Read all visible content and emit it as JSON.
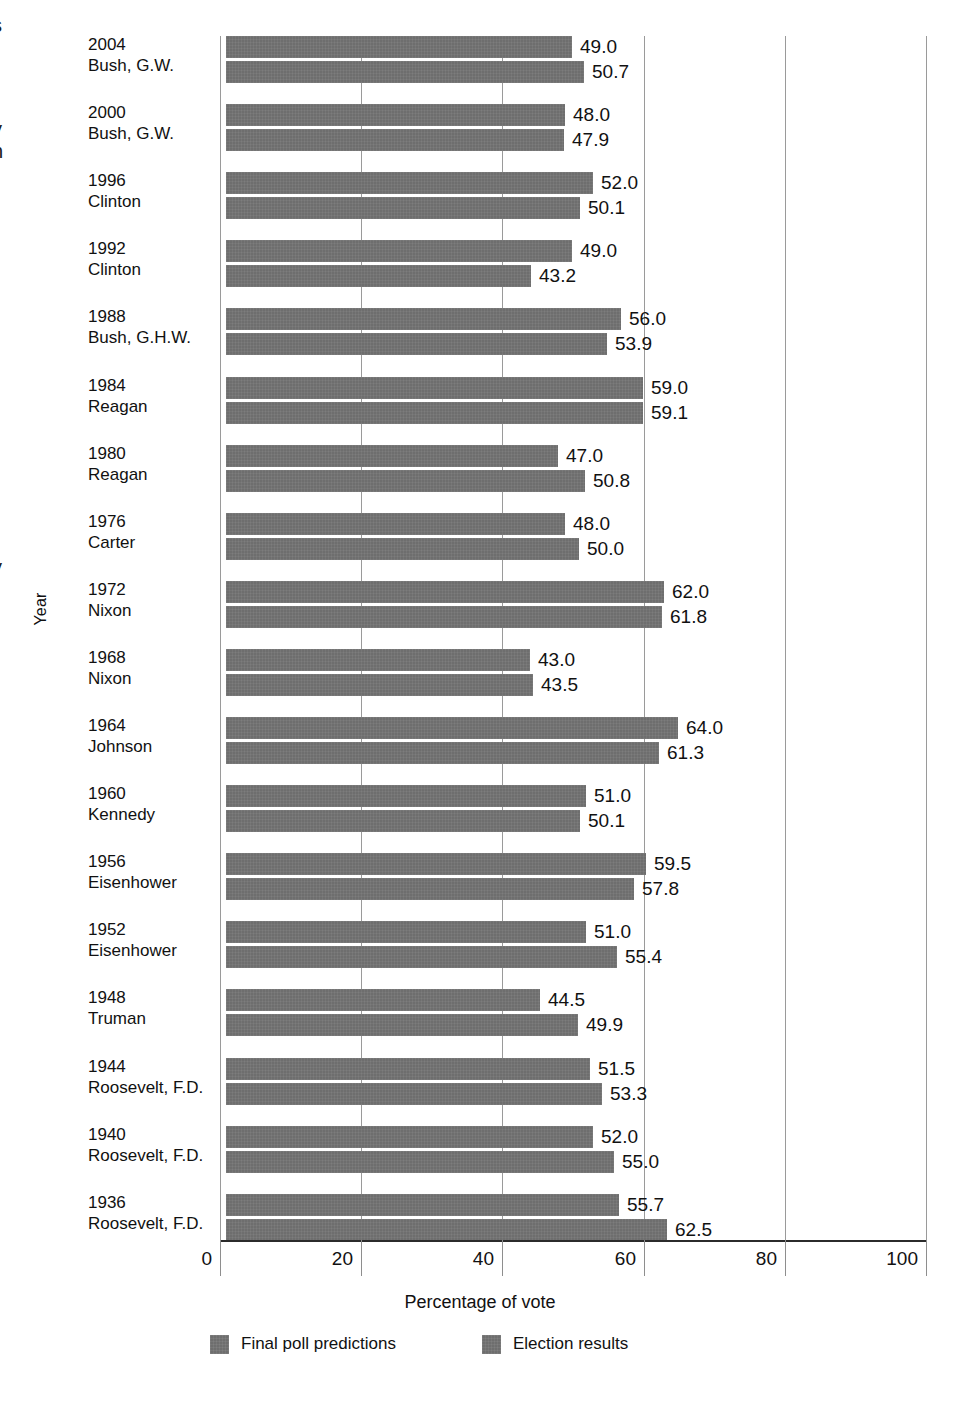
{
  "chart_data": {
    "type": "bar",
    "orientation": "horizontal",
    "title": "",
    "xlabel": "Percentage of vote",
    "ylabel": "Year",
    "xlim": [
      0,
      100
    ],
    "xticks": [
      0,
      20,
      40,
      60,
      80,
      100
    ],
    "grid": true,
    "legend_position": "bottom",
    "categories": [
      {
        "year": "2004",
        "name": "Bush, G.W."
      },
      {
        "year": "2000",
        "name": "Bush, G.W."
      },
      {
        "year": "1996",
        "name": "Clinton"
      },
      {
        "year": "1992",
        "name": "Clinton"
      },
      {
        "year": "1988",
        "name": "Bush, G.H.W."
      },
      {
        "year": "1984",
        "name": "Reagan"
      },
      {
        "year": "1980",
        "name": "Reagan"
      },
      {
        "year": "1976",
        "name": "Carter"
      },
      {
        "year": "1972",
        "name": "Nixon"
      },
      {
        "year": "1968",
        "name": "Nixon"
      },
      {
        "year": "1964",
        "name": "Johnson"
      },
      {
        "year": "1960",
        "name": "Kennedy"
      },
      {
        "year": "1956",
        "name": "Eisenhower"
      },
      {
        "year": "1952",
        "name": "Eisenhower"
      },
      {
        "year": "1948",
        "name": "Truman"
      },
      {
        "year": "1944",
        "name": "Roosevelt, F.D."
      },
      {
        "year": "1940",
        "name": "Roosevelt, F.D."
      },
      {
        "year": "1936",
        "name": "Roosevelt, F.D."
      }
    ],
    "series": [
      {
        "name": "Final poll predictions",
        "color": "#6e6e6e",
        "values": [
          49.0,
          48.0,
          52.0,
          49.0,
          56.0,
          59.0,
          47.0,
          48.0,
          62.0,
          43.0,
          64.0,
          51.0,
          59.5,
          51.0,
          44.5,
          51.5,
          52.0,
          55.7
        ],
        "labels": [
          "49.0",
          "48.0",
          "52.0",
          "49.0",
          "56.0",
          "59.0",
          "47.0",
          "48.0",
          "62.0",
          "43.0",
          "64.0",
          "51.0",
          "59.5",
          "51.0",
          "44.5",
          "51.5",
          "52.0",
          "55.7"
        ]
      },
      {
        "name": "Election results",
        "color": "#6e6e6e",
        "values": [
          50.7,
          47.9,
          50.1,
          43.2,
          53.9,
          59.1,
          50.8,
          50.0,
          61.8,
          43.5,
          61.3,
          50.1,
          57.8,
          55.4,
          49.9,
          53.3,
          55.0,
          62.5
        ],
        "labels": [
          "50.7",
          "47.9",
          "50.1",
          "43.2",
          "53.9",
          "59.1",
          "50.8",
          "50.0",
          "61.8",
          "43.5",
          "61.3",
          "50.1",
          "57.8",
          "55.4",
          "49.9",
          "53.3",
          "55.0",
          "62.5"
        ]
      }
    ]
  },
  "axis": {
    "y_title": "Year",
    "x_title": "Percentage of vote",
    "x_tick_labels": [
      "0",
      "20",
      "40",
      "60",
      "80",
      "100"
    ]
  },
  "legend": {
    "items": [
      {
        "label": "Final poll predictions"
      },
      {
        "label": "Election results"
      }
    ]
  },
  "edge_fragments": [
    {
      "text": "s",
      "top": 14
    },
    {
      "text": "y",
      "top": 118
    },
    {
      "text": "n",
      "top": 140
    },
    {
      "text": "y",
      "top": 556
    }
  ]
}
